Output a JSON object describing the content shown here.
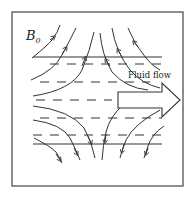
{
  "figure": {
    "label_field": "B",
    "label_field_subscript": "0",
    "label_flow": "Fluid flow",
    "colors": {
      "stroke": "#333333",
      "background": "#ffffff"
    },
    "elements": {
      "frame": "square border",
      "solid_lines": 2,
      "dashed_rows": 5,
      "field_line_arrows": 12,
      "flow_arrow": "outlined block arrow pointing right"
    }
  }
}
